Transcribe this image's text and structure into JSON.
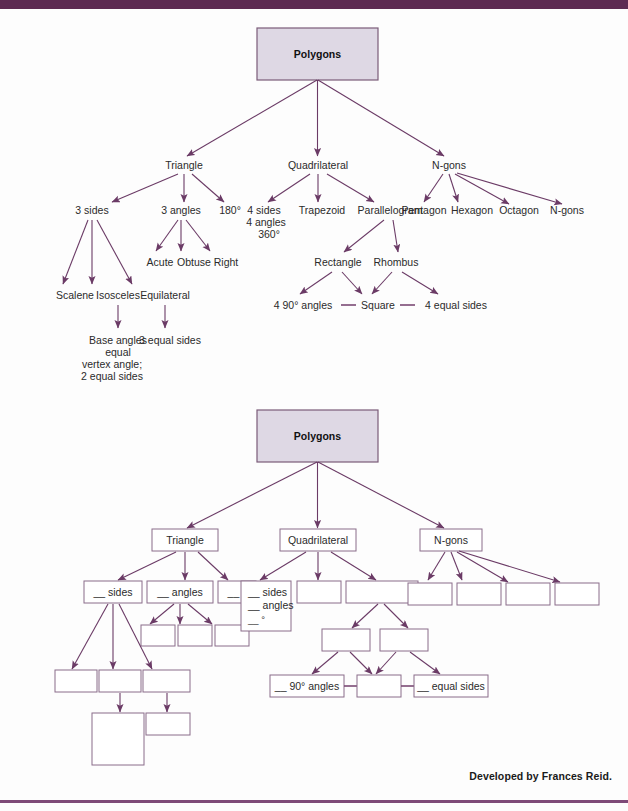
{
  "page": {
    "credit": "Developed by Frances Reid.",
    "accent_color": "#5d2a52",
    "rule_color": "#7e4a78",
    "root_fill": "#ded8e4",
    "line_color": "#6b3b66",
    "box_stroke": "#8a6d8a"
  },
  "diagram_filled": {
    "root": "Polygons",
    "level1": [
      "Triangle",
      "Quadrilateral",
      "N-gons"
    ],
    "triangle": {
      "children": [
        "3 sides",
        "3 angles",
        "180°"
      ],
      "angles_children": [
        "Acute",
        "Obtuse",
        "Right"
      ],
      "sides_children": [
        "Scalene",
        "Isosceles",
        "Equilateral"
      ],
      "isosceles_detail": [
        "Base angles",
        "equal",
        "vertex angle;",
        "2 equal sides"
      ],
      "equilateral_detail": "3 equal sides"
    },
    "quadrilateral": {
      "children": [
        "4 sides",
        "Trapezoid",
        "Parallelogram"
      ],
      "sides_detail": [
        "4 sides",
        "4 angles",
        "360°"
      ],
      "parallelogram_children": [
        "Rectangle",
        "Rhombus"
      ],
      "square_row": [
        "4 90° angles",
        "Square",
        "4 equal sides"
      ]
    },
    "ngons": {
      "children": [
        "Pentagon",
        "Hexagon",
        "Octagon",
        "N-gons"
      ]
    }
  },
  "diagram_blank": {
    "root": "Polygons",
    "level1": [
      "Triangle",
      "Quadrilateral",
      "N-gons"
    ],
    "triangle": {
      "children": [
        "__ sides",
        "__ angles",
        "__ °"
      ],
      "angles_children": [
        "",
        "",
        ""
      ],
      "sides_children": [
        "",
        "",
        ""
      ],
      "isosceles_detail": "",
      "equilateral_detail": ""
    },
    "quadrilateral": {
      "sides_detail": [
        "__ sides",
        "__ angles",
        "__ °"
      ],
      "children": [
        "",
        ""
      ],
      "parallelogram_children": [
        "",
        ""
      ],
      "square_row": [
        "__ 90° angles",
        "",
        "__ equal sides"
      ]
    },
    "ngons": {
      "children": [
        "",
        "",
        "",
        ""
      ]
    }
  }
}
